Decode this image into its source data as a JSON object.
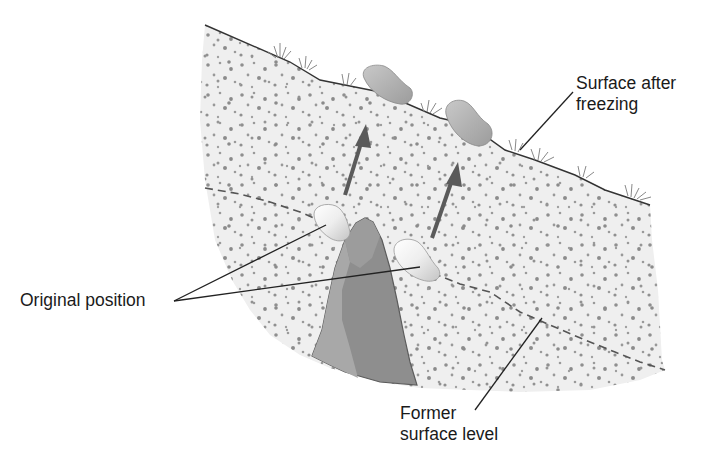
{
  "diagram": {
    "labels": {
      "surface_after_freezing": {
        "line1": "Surface after",
        "line2": "freezing"
      },
      "original_position": "Original position",
      "former_surface_level": {
        "line1": "Former",
        "line2": "surface level"
      }
    },
    "elements": {
      "soil_block": "soil-cross-section",
      "bedrock": "bedrock-outcrop",
      "stones_heaved": [
        "stone-upper-left",
        "stone-upper-right"
      ],
      "stones_original": [
        "stone-original-left",
        "stone-original-right"
      ],
      "arrows": [
        "upward-arrow-left",
        "upward-arrow-right"
      ],
      "former_surface": "dashed-line",
      "current_surface": "solid-line"
    },
    "colors": {
      "soil_fill": "#efefef",
      "soil_dots": "#8f8f8f",
      "bedrock_dark": "#8a8a8a",
      "bedrock_light": "#a6a6a6",
      "stone": "#b8b8b8",
      "stone_light": "#f4f4f4",
      "arrow": "#5a5a5a",
      "line": "#333333",
      "text": "#1a1a1a"
    }
  }
}
